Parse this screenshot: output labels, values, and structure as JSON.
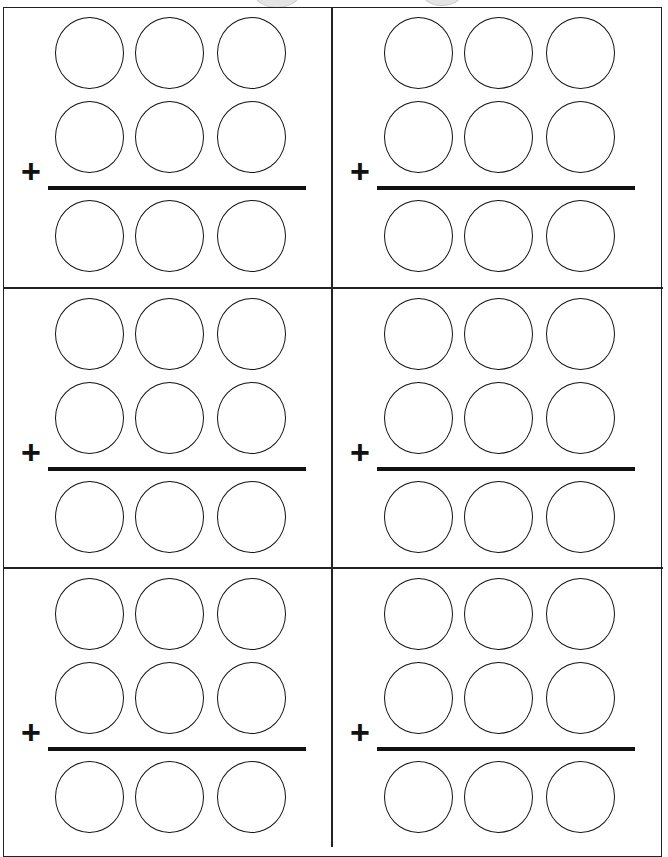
{
  "worksheet": {
    "type": "3-digit addition practice",
    "operator_symbol": "+",
    "problems": [
      {
        "id": 1,
        "position": "top-left",
        "addend1_digits": [
          "",
          "",
          ""
        ],
        "addend2_digits": [
          "",
          "",
          ""
        ],
        "sum_digits": [
          "",
          "",
          ""
        ]
      },
      {
        "id": 2,
        "position": "top-right",
        "addend1_digits": [
          "",
          "",
          ""
        ],
        "addend2_digits": [
          "",
          "",
          ""
        ],
        "sum_digits": [
          "",
          "",
          ""
        ]
      },
      {
        "id": 3,
        "position": "middle-left",
        "addend1_digits": [
          "",
          "",
          ""
        ],
        "addend2_digits": [
          "",
          "",
          ""
        ],
        "sum_digits": [
          "",
          "",
          ""
        ]
      },
      {
        "id": 4,
        "position": "middle-right",
        "addend1_digits": [
          "",
          "",
          ""
        ],
        "addend2_digits": [
          "",
          "",
          ""
        ],
        "sum_digits": [
          "",
          "",
          ""
        ]
      },
      {
        "id": 5,
        "position": "bottom-left",
        "addend1_digits": [
          "",
          "",
          ""
        ],
        "addend2_digits": [
          "",
          "",
          ""
        ],
        "sum_digits": [
          "",
          "",
          ""
        ]
      },
      {
        "id": 6,
        "position": "bottom-right",
        "addend1_digits": [
          "",
          "",
          ""
        ],
        "addend2_digits": [
          "",
          "",
          ""
        ],
        "sum_digits": [
          "",
          "",
          ""
        ]
      }
    ]
  },
  "colors": {
    "ink": "#111111",
    "paper": "#ffffff",
    "punch_hole": "#e4e4e4"
  }
}
